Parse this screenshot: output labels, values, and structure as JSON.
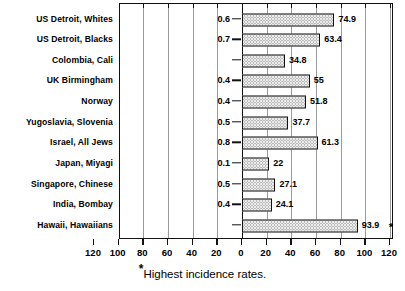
{
  "chart_data": {
    "type": "bar",
    "title": "",
    "subtitle": "",
    "orientation": "horizontal",
    "style": "bidirectional-paired-bar",
    "xlabel": "",
    "ylabel": "",
    "grid": true,
    "legend": null,
    "axis": {
      "left_range": [
        120,
        0
      ],
      "right_range": [
        0,
        120
      ],
      "tick_step": 20,
      "tick_labels": [
        "120",
        "100",
        "80",
        "60",
        "40",
        "20",
        "0",
        "20",
        "40",
        "60",
        "80",
        "100",
        "120"
      ],
      "tick_values": [
        -120,
        -100,
        -80,
        -60,
        -40,
        -20,
        0,
        20,
        40,
        60,
        80,
        100,
        120
      ]
    },
    "categories": [
      "US Detroit, Whites",
      "US Detroit, Blacks",
      "Colombia, Cali",
      "UK Birmingham",
      "Norway",
      "Yugoslavia, Slovenia",
      "Israel, All Jews",
      "Japan, Miyagi",
      "Singapore, Chinese",
      "India, Bombay",
      "Hawaii, Hawaiians"
    ],
    "series": [
      {
        "name": "left-value",
        "side": "left",
        "values": [
          0.6,
          0.7,
          null,
          0.4,
          0.4,
          0.5,
          0.8,
          0.1,
          0.5,
          0.4,
          null
        ],
        "labels": [
          "0.6",
          "0.7",
          "",
          "0.4",
          "0.4",
          "0.5",
          "0.8",
          "0.1",
          "0.5",
          "0.4",
          ""
        ]
      },
      {
        "name": "right-value",
        "side": "right",
        "values": [
          74.9,
          63.4,
          34.8,
          55,
          51.8,
          37.7,
          61.3,
          22,
          27.1,
          24.1,
          93.9
        ],
        "labels": [
          "74.9",
          "63.4",
          "34.8",
          "55",
          "51.8",
          "37.7",
          "61.3",
          "22",
          "27.1",
          "24.1",
          "93.9"
        ]
      }
    ],
    "annotations": [
      {
        "name": "highest-incidence-marker",
        "symbol": "*",
        "attached_to": "Hawaii, Hawaiians"
      }
    ]
  },
  "footnote": {
    "star": "*",
    "text": "Highest incidence rates."
  },
  "colors": {
    "bar_fill": "#ebebeb",
    "bar_stipple": "#8c8c8c",
    "bar_border": "#111111",
    "axis": "#111111",
    "grid": "#9a9a9a",
    "text": "#000000",
    "background": "#ffffff"
  }
}
